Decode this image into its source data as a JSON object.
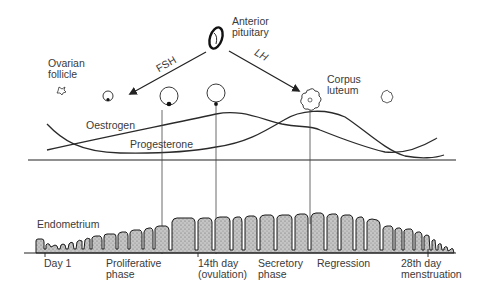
{
  "pituitary": {
    "label_line1": "Anterior",
    "label_line2": "pituitary",
    "icon": "pituitary-gland-icon"
  },
  "hormone_arrows": [
    {
      "label": "FSH",
      "target": "developing follicle"
    },
    {
      "label": "LH",
      "target": "corpus luteum"
    }
  ],
  "ovary": {
    "follicle_label_line1": "Ovarian",
    "follicle_label_line2": "follicle",
    "corpus_luteum_label_line1": "Corpus",
    "corpus_luteum_label_line2": "luteum",
    "stages": [
      "primordial follicle",
      "small follicle",
      "growing follicle",
      "mature follicle",
      "corpus luteum",
      "regressing corpus luteum"
    ]
  },
  "hormone_curves": {
    "oestrogen_label": "Oestrogen",
    "progesterone_label": "Progesterone"
  },
  "endometrium": {
    "label": "Endometrium"
  },
  "timeline": {
    "labels": [
      {
        "line1": "Day 1",
        "line2": ""
      },
      {
        "line1": "Proliferative",
        "line2": "phase"
      },
      {
        "line1": "14th day",
        "line2": "(ovulation)"
      },
      {
        "line1": "Secretory",
        "line2": "phase"
      },
      {
        "line1": "Regression",
        "line2": ""
      },
      {
        "line1": "28th day",
        "line2": "menstruation"
      }
    ]
  },
  "colors": {
    "ink": "#222222",
    "text": "#3a3a3a",
    "stipple": "#9a9a9a",
    "background": "#ffffff"
  }
}
